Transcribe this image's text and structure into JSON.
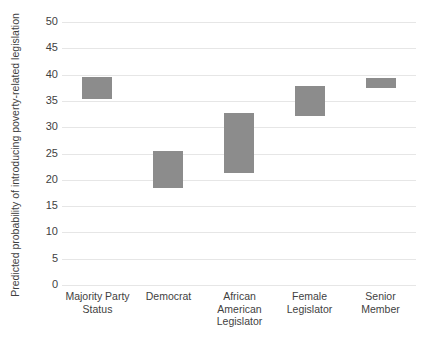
{
  "chart_data": {
    "type": "bar",
    "bar_style": "floating-range",
    "title": "",
    "xlabel": "",
    "ylabel": "Predicted probability of introducing poverty-related legislation",
    "ylim": [
      0,
      50
    ],
    "ytick_step": 5,
    "ytick_labels": [
      "50",
      "45",
      "40",
      "35",
      "30",
      "25",
      "20",
      "15",
      "10",
      "5",
      "0"
    ],
    "ytick_values": [
      50,
      45,
      40,
      35,
      30,
      25,
      20,
      15,
      10,
      5,
      0
    ],
    "grid": true,
    "legend": "none",
    "bar_color": "#8c8c8c",
    "gridline_color": "#e6e6e6",
    "text_color": "#3f3f3f",
    "categories": [
      "Majority Party Status",
      "Democrat",
      "African American Legislator",
      "Female Legislator",
      "Senior Member"
    ],
    "category_lines": [
      [
        "Majority Party",
        "Status"
      ],
      [
        "Democrat"
      ],
      [
        "African",
        "American",
        "Legislator"
      ],
      [
        "Female",
        "Legislator"
      ],
      [
        "Senior",
        "Member"
      ]
    ],
    "bars": [
      {
        "category": "Majority Party Status",
        "low": 35.3,
        "high": 39.5
      },
      {
        "category": "Democrat",
        "low": 18.5,
        "high": 25.5
      },
      {
        "category": "African American Legislator",
        "low": 21.2,
        "high": 32.7
      },
      {
        "category": "Female Legislator",
        "low": 32.2,
        "high": 37.9
      },
      {
        "category": "Senior Member",
        "low": 37.5,
        "high": 39.4
      }
    ]
  }
}
